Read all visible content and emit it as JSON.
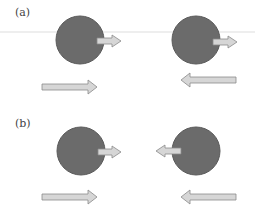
{
  "figure": {
    "panels": [
      {
        "label": "(a)",
        "spheres": [
          {
            "cx": 80,
            "cy": 40,
            "r": 24,
            "spin_arrow": "right"
          },
          {
            "cx": 196,
            "cy": 40,
            "r": 24,
            "spin_arrow": "right"
          }
        ],
        "motion_arrows": [
          "right",
          "left"
        ]
      },
      {
        "label": "(b)",
        "spheres": [
          {
            "cx": 81,
            "cy": 151,
            "r": 24,
            "spin_arrow": "right"
          },
          {
            "cx": 196,
            "cy": 151,
            "r": 24,
            "spin_arrow": "left"
          }
        ],
        "motion_arrows": [
          "right",
          "left"
        ]
      }
    ],
    "colors": {
      "sphere_fill": "#6b6b6b",
      "sphere_stroke": "#555555",
      "arrow_fill": "#d6d6d6",
      "arrow_stroke": "#8a8a8a",
      "artifact_line": "#e4e4e4"
    }
  }
}
